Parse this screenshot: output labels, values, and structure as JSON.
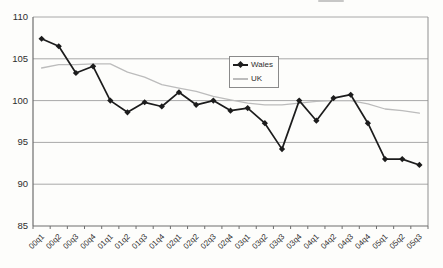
{
  "chart_data": {
    "type": "line",
    "categories": [
      "00q1",
      "00q2",
      "00q3",
      "00q4",
      "01q1",
      "01q2",
      "01q3",
      "01q4",
      "02q1",
      "02q2",
      "02q3",
      "02q4",
      "03q1",
      "03q2",
      "03q3",
      "03q4",
      "04q1",
      "04q2",
      "04q3",
      "04q4",
      "05q1",
      "05q2",
      "05q3"
    ],
    "series": [
      {
        "name": "Wales",
        "color": "#1c1c1c",
        "marker": "diamond",
        "values": [
          107.4,
          106.5,
          103.3,
          104.1,
          100.0,
          98.6,
          99.8,
          99.3,
          101.0,
          99.5,
          100.0,
          98.8,
          99.1,
          97.3,
          94.2,
          100.0,
          97.6,
          100.3,
          100.7,
          97.3,
          93.0,
          93.0,
          92.3
        ]
      },
      {
        "name": "UK",
        "color": "#bcbcbc",
        "marker": "none",
        "values": [
          103.9,
          104.3,
          104.3,
          104.4,
          104.4,
          103.4,
          102.8,
          101.9,
          101.5,
          101.1,
          100.5,
          100.1,
          99.7,
          99.5,
          99.5,
          99.7,
          99.9,
          100.0,
          100.0,
          99.6,
          99.0,
          98.8,
          98.5
        ]
      }
    ],
    "title": "",
    "xlabel": "",
    "ylabel": "",
    "ylim": [
      85,
      110
    ],
    "yticks": [
      85,
      90,
      95,
      100,
      105,
      110
    ],
    "grid": true,
    "legend_position": "inside-top-center"
  }
}
